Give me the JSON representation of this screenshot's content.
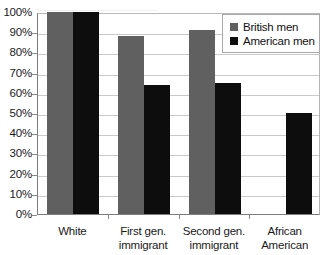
{
  "chart_data": {
    "type": "bar",
    "title": "",
    "subtitle": "",
    "xlabel": "",
    "ylabel": "",
    "categories": [
      "White",
      "First gen. immigrant",
      "Second gen. immigrant",
      "African American"
    ],
    "series": [
      {
        "name": "British men",
        "color": "#606060",
        "values": [
          100,
          88,
          91,
          null
        ]
      },
      {
        "name": "American men",
        "color": "#0d0d0d",
        "values": [
          100,
          64,
          65,
          50
        ]
      }
    ],
    "ylim": [
      0,
      100
    ],
    "ytick_step": 10,
    "ytick_labels": [
      "100%",
      "90%",
      "80%",
      "70%",
      "60%",
      "50%",
      "40%",
      "30%",
      "20%",
      "10%",
      "0%"
    ],
    "ytick_values": [
      100,
      90,
      80,
      70,
      60,
      50,
      40,
      30,
      20,
      10,
      0
    ],
    "value_suffix": "%",
    "grid": true,
    "grid_axis": "y",
    "legend_position": "top-right",
    "legend_border": true,
    "annotations": []
  },
  "legend": {
    "entries": [
      {
        "label": "British men",
        "swatch": "#606060"
      },
      {
        "label": "American men",
        "swatch": "#0d0d0d"
      }
    ]
  },
  "axis": {
    "y_line_color": "#7d7d7d",
    "grid_color": "#c9c9c9"
  }
}
